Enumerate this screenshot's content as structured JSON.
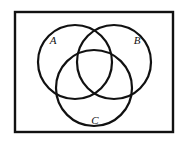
{
  "figure": {
    "name": "three-set-venn-diagram",
    "type": "venn",
    "sets": 3,
    "background_color": "#ffffff",
    "stroke_color": "#111111",
    "universe": {
      "label": "",
      "shape": "rectangle",
      "x": 15,
      "y": 12,
      "width": 158,
      "height": 120,
      "stroke_width": 2.4,
      "fill": "#ffffff"
    },
    "circles": [
      {
        "id": "A",
        "label": "A",
        "cx": 75,
        "cy": 62,
        "r": 37,
        "stroke_width": 2.2,
        "fill": "none",
        "label_x": 53,
        "label_y": 44,
        "label_font_size": 11
      },
      {
        "id": "B",
        "label": "B",
        "cx": 114,
        "cy": 62,
        "r": 37,
        "stroke_width": 2.2,
        "fill": "none",
        "label_x": 133,
        "label_y": 44,
        "label_font_size": 11
      },
      {
        "id": "C",
        "label": "C",
        "cx": 94,
        "cy": 88,
        "r": 38,
        "stroke_width": 2.2,
        "fill": "none",
        "label_x": 91,
        "label_y": 124,
        "label_font_size": 11
      }
    ]
  }
}
